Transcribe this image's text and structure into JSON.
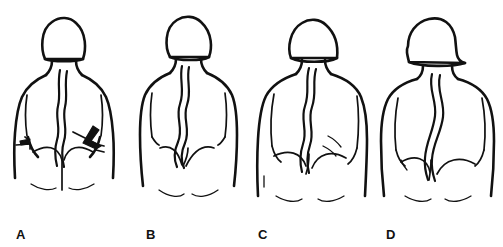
{
  "plate": {
    "title": "Four posterior views of the trunk illustrating spinal curvature",
    "background_color": "#ffffff",
    "ink_color": "#111111",
    "style": "black-and-white line drawing",
    "panel_count": 4
  },
  "panels": [
    {
      "label": "A",
      "caption": "Posterior view with hands on hips; narrow trunk, spine traced as a double line with a mild lateral wave",
      "features": {
        "hair": "chin-length bell-shaped bob",
        "arms": "bent with hands resting on the waist, hands filled solid black",
        "spine": "double-line S wave, mild",
        "buttocks": "two rounded contours with dashed gluteal folds"
      }
    },
    {
      "label": "B",
      "caption": "Posterior view with arms hanging at the sides; pronounced S-shaped spinal curve",
      "features": {
        "hair": "chin-length bell-shaped bob",
        "arms": "relaxed at the sides",
        "spine": "double-line S wave, pronounced",
        "buttocks": "two rounded contours with dashed gluteal folds"
      }
    },
    {
      "label": "C",
      "caption": "Posterior view of a broader trunk; spine curves laterally toward the left with a visible waist crease",
      "features": {
        "hair": "short flared bob",
        "arms": "relaxed at the sides",
        "spine": "double-line curve deviating to one side",
        "buttocks": "two rounded contours with dashed gluteal folds"
      }
    },
    {
      "label": "D",
      "caption": "Posterior view of a broad trunk with square shoulders; long sweeping spinal curve",
      "features": {
        "hair": "tall bell-shaped bob with flared hem",
        "arms": "relaxed at the sides",
        "spine": "double-line long sweeping curve",
        "buttocks": "two rounded contours with dashed gluteal folds"
      }
    }
  ]
}
